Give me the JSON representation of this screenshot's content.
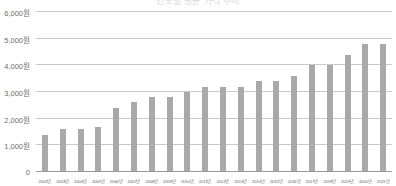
{
  "chart_data": {
    "type": "bar",
    "title": "연도별 평균 가격 추이",
    "xlabel": "",
    "ylabel": "",
    "ylim": [
      0,
      6000
    ],
    "grid": true,
    "legend": "none",
    "unit_suffix": "원",
    "categories": [
      "2002년",
      "2003년",
      "2004년",
      "2005년",
      "2006년",
      "2007년",
      "2008년",
      "2009년",
      "2010년",
      "2011년",
      "2012년",
      "2013년",
      "2014년",
      "2015년",
      "2016년",
      "2017년",
      "2018년",
      "2019년",
      "2020년",
      "2021년"
    ],
    "values": [
      1350,
      1570,
      1570,
      1650,
      2350,
      2570,
      2770,
      2770,
      2970,
      3160,
      3160,
      3160,
      3360,
      3360,
      3550,
      3970,
      3970,
      4350,
      4750,
      4750
    ],
    "ytick_values": [
      0,
      1000,
      2000,
      3000,
      4000,
      5000,
      6000
    ],
    "ytick_labels": [
      "0",
      "1,000원",
      "2,000원",
      "3,000원",
      "4,000원",
      "5,000원",
      "6,000원"
    ],
    "bar_color": "#a9a9a9",
    "grid_color": "#c9c9c9",
    "axis_color": "#9a9a9a",
    "label_color": "#6d6d6d",
    "background": "#ffffff"
  }
}
